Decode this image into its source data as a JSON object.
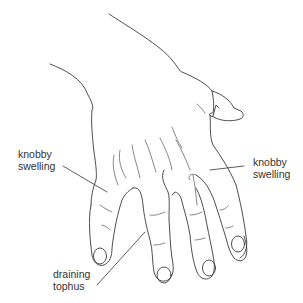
{
  "figure": {
    "line_color": "#3a3a3a",
    "background": "#ffffff"
  },
  "labels": {
    "left": {
      "line1": "knobby",
      "line2": "swelling"
    },
    "right": {
      "line1": "knobby",
      "line2": "swelling"
    },
    "bottom": {
      "line1": "draining",
      "line2": "tophus"
    }
  }
}
